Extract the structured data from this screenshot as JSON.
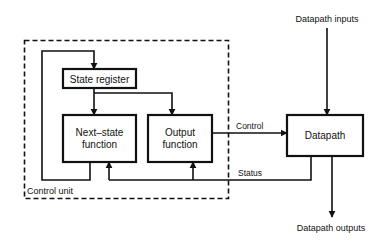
{
  "diagram": {
    "colors": {
      "stroke": "#111111",
      "background": "#ffffff"
    },
    "nodes": {
      "state_register": {
        "label": "State register"
      },
      "next_state": {
        "line1": "Next–state",
        "line2": "function"
      },
      "output_function": {
        "line1": "Output",
        "line2": "function"
      },
      "datapath": {
        "label": "Datapath"
      }
    },
    "labels": {
      "control_unit": "Control unit",
      "control": "Control",
      "status": "Status",
      "datapath_inputs": "Datapath inputs",
      "datapath_outputs": "Datapath outputs"
    }
  }
}
